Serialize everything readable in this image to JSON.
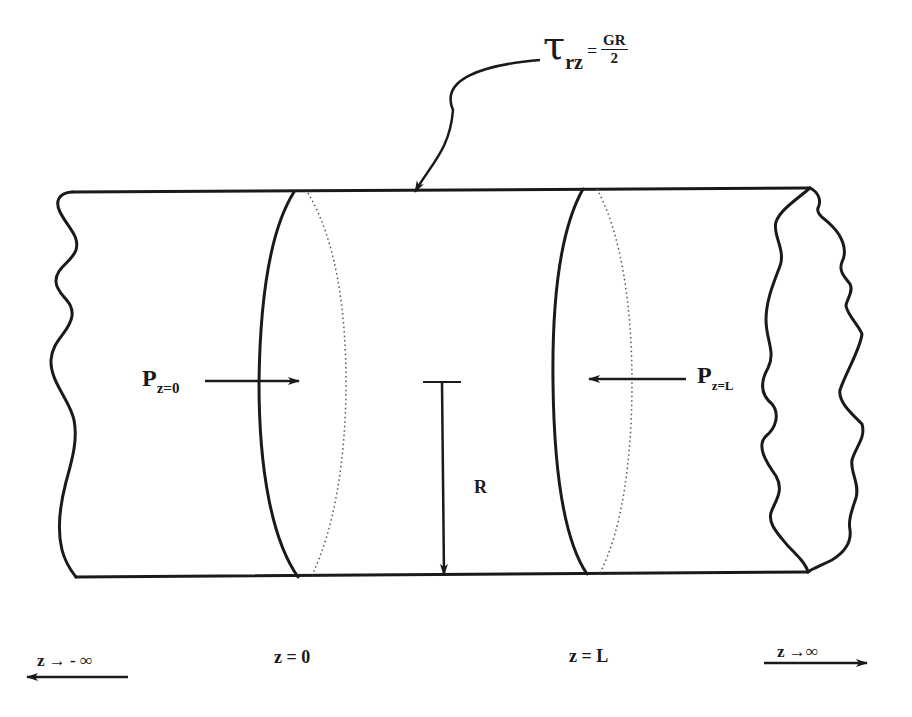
{
  "diagram": {
    "stroke_color": "#1a1a1a",
    "background": "#ffffff"
  },
  "labels": {
    "shear_stress": {
      "symbol": "τ",
      "subscript": "rz",
      "equals": "=",
      "numerator": "GR",
      "denominator": "2"
    },
    "pressure_inlet": {
      "symbol": "P",
      "subscript": "z=0"
    },
    "pressure_outlet": {
      "symbol": "P",
      "subscript": "z=L"
    },
    "radius": "R",
    "axis": {
      "left_limit": "z  →  - ∞",
      "inlet_position": "z = 0",
      "outlet_position": "z = L",
      "right_limit": "z →∞"
    }
  }
}
